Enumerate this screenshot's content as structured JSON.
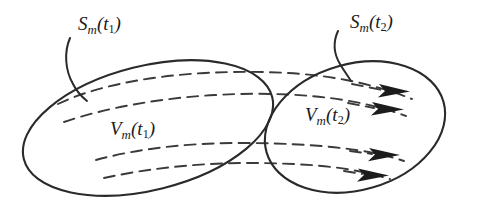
{
  "figure": {
    "type": "diagram",
    "background_color": "#ffffff",
    "stroke_color": "#2a2a2a",
    "dash_color": "#3a3a3a",
    "arrow_fill": "#1c1c1c"
  },
  "labels": {
    "surface_t1": {
      "symbol": "S",
      "subscript": "m",
      "open_paren": "(",
      "arg": "t",
      "arg_subscript": "1",
      "close_paren": ")",
      "full_text": "Sm(t1)"
    },
    "surface_t2": {
      "symbol": "S",
      "subscript": "m",
      "open_paren": "(",
      "arg": "t",
      "arg_subscript": "2",
      "close_paren": ")",
      "full_text": "Sm(t2)"
    },
    "volume_t1": {
      "symbol": "V",
      "subscript": "m",
      "open_paren": "(",
      "arg": "t",
      "arg_subscript": "1",
      "close_paren": ")",
      "full_text": "Vm(t1)"
    },
    "volume_t2": {
      "symbol": "V",
      "subscript": "m",
      "open_paren": "(",
      "arg": "t",
      "arg_subscript": "2",
      "close_paren": ")",
      "full_text": "Vm(t2)"
    }
  },
  "shapes": {
    "ellipse_left": {
      "name": "material-volume-at-t1",
      "cx": 148,
      "cy": 128,
      "rx": 128,
      "ry": 62,
      "rotation_deg": -14
    },
    "ellipse_right": {
      "name": "material-volume-at-t2",
      "cx": 355,
      "cy": 127,
      "rx": 92,
      "ry": 63,
      "rotation_deg": -16
    },
    "leader_left": {
      "name": "leader-line-surface-t1",
      "from": [
        72,
        40
      ],
      "to": [
        85,
        98
      ]
    },
    "leader_right": {
      "name": "leader-line-surface-t2",
      "from": [
        338,
        32
      ],
      "to": [
        348,
        80
      ]
    },
    "pathlines_count": 4,
    "arrowheads_count": 4
  }
}
